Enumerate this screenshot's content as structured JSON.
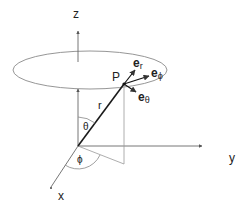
{
  "diagram": {
    "axes": {
      "z": "z",
      "y": "y",
      "x": "x"
    },
    "point": "P",
    "radius_label": "r",
    "polar_angle": "θ",
    "azimuth_angle": "ϕ",
    "unit_vectors": {
      "er": {
        "base": "e",
        "sub": "r"
      },
      "ephi": {
        "base": "e",
        "sub": "ϕ"
      },
      "etheta": {
        "base": "e",
        "sub": "θ"
      }
    },
    "colors": {
      "axis": "#555555",
      "vector": "#1a1a1a",
      "ellipse": "#888888"
    }
  }
}
